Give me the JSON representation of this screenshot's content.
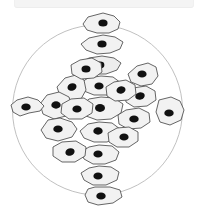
{
  "figure": {
    "kind": "cell-culture-diagram",
    "caption": "",
    "background_color": "#ffffff"
  },
  "top_strip": {
    "visible": true,
    "fill_color": "#f4f4f4",
    "border_color": "#ededed"
  },
  "dish": {
    "label": "culture-dish-outline",
    "shape": "circle",
    "cx": 97.5,
    "cy": 110,
    "r": 85,
    "fill_color": "#ffffff",
    "stroke_color": "#b9b9b9",
    "stroke_width": 0.9
  },
  "style": {
    "cell_fill_color": "#f2f2f2",
    "cell_fill_color_alt": "#ededed",
    "cell_stroke_color": "#4a4a4a",
    "cell_stroke_width": 0.85,
    "nucleus_color": "#111111"
  },
  "cells": [
    {
      "id": "cell-01",
      "group": "vertical-arm",
      "fill": "#f2f2f2",
      "outline": "103,13 114,16 120,22 118,29 109,33 97,33 87,30 83,24 88,17",
      "nucleus": {
        "cx": 103,
        "cy": 23,
        "rx": 4.6,
        "ry": 3.5,
        "rot": 0
      }
    },
    {
      "id": "cell-02",
      "group": "vertical-arm",
      "fill": "#f2f2f2",
      "outline": "103,35 115,37 123,42 120,49 110,53 97,54 86,50 81,44 89,38",
      "nucleus": {
        "cx": 102,
        "cy": 44,
        "rx": 4.6,
        "ry": 3.5,
        "rot": 0
      }
    },
    {
      "id": "cell-03",
      "group": "vertical-arm",
      "fill": "#ededed",
      "outline": "102,56 114,58 121,63 117,70 106,74 94,74 84,70 80,63 89,58",
      "nucleus": {
        "cx": 100,
        "cy": 65,
        "rx": 4.4,
        "ry": 3.4,
        "rot": 0
      }
    },
    {
      "id": "cell-04",
      "group": "vertical-arm",
      "fill": "#f2f2f2",
      "outline": "101,76 113,77 121,83 118,91 107,95 94,95 84,91 79,84 88,78",
      "nucleus": {
        "cx": 99,
        "cy": 86,
        "rx": 4.6,
        "ry": 3.6,
        "rot": 0
      }
    },
    {
      "id": "cell-05",
      "group": "center-cluster",
      "fill": "#f2f2f2",
      "outline": "101,97 114,98 123,104 121,113 111,119 97,120 86,116 80,107 89,99",
      "nucleus": {
        "cx": 100,
        "cy": 108,
        "rx": 5.0,
        "ry": 3.9,
        "rot": 0
      }
    },
    {
      "id": "cell-06",
      "group": "vertical-arm",
      "fill": "#f2f2f2",
      "outline": "99,122 112,123 120,129 118,137 107,142 94,142 84,138 80,131 88,124",
      "nucleus": {
        "cx": 98,
        "cy": 131,
        "rx": 4.7,
        "ry": 3.7,
        "rot": 0
      }
    },
    {
      "id": "cell-07",
      "group": "vertical-arm",
      "fill": "#f2f2f2",
      "outline": "99,145 112,146 119,152 116,160 105,164 93,164 84,159 81,152 89,147",
      "nucleus": {
        "cx": 98,
        "cy": 154,
        "rx": 4.6,
        "ry": 3.6,
        "rot": 0
      }
    },
    {
      "id": "cell-08",
      "group": "vertical-arm",
      "fill": "#f2f2f2",
      "outline": "99,166 111,167 119,172 117,180 106,185 93,185 84,180 81,173 89,168",
      "nucleus": {
        "cx": 98,
        "cy": 176,
        "rx": 4.6,
        "ry": 3.6,
        "rot": 0
      }
    },
    {
      "id": "cell-09",
      "group": "vertical-arm",
      "fill": "#f2f2f2",
      "outline": "95,187 110,187 120,190 122,197 113,203 98,205 88,202 85,195 88,189",
      "nucleus": {
        "cx": 101,
        "cy": 196,
        "rx": 4.7,
        "ry": 3.6,
        "rot": 0
      }
    },
    {
      "id": "cell-10",
      "group": "upper-right",
      "fill": "#f2f2f2",
      "outline": "137,66 148,63 156,67 158,76 152,84 141,86 131,82 128,74",
      "nucleus": {
        "cx": 142,
        "cy": 74,
        "rx": 4.6,
        "ry": 3.6,
        "rot": 0
      }
    },
    {
      "id": "cell-11",
      "group": "right-arm",
      "fill": "#f2f2f2",
      "outline": "133,88 146,86 155,91 156,100 147,106 134,107 126,102 125,93",
      "nucleus": {
        "cx": 140,
        "cy": 96,
        "rx": 4.8,
        "ry": 3.6,
        "rot": -14
      }
    },
    {
      "id": "cell-12",
      "group": "upper-left",
      "fill": "#f2f2f2",
      "outline": "65,78 76,75 84,80 86,90 81,99 70,101 60,96 57,87",
      "nucleus": {
        "cx": 72,
        "cy": 87,
        "rx": 4.6,
        "ry": 3.6,
        "rot": -18
      }
    },
    {
      "id": "cell-13",
      "group": "left-arm",
      "fill": "#f2f2f2",
      "outline": "47,95 59,92 69,97 72,107 66,116 54,119 43,114 40,104",
      "nucleus": {
        "cx": 56,
        "cy": 105,
        "rx": 4.7,
        "ry": 3.7,
        "rot": 0
      }
    },
    {
      "id": "cell-14",
      "group": "left-arm-tip",
      "fill": "#f2f2f2",
      "outline": "17,100 28,97 38,100 44,106 40,111 29,113 20,116 13,112 11,105",
      "nucleus": {
        "cx": 26,
        "cy": 107,
        "rx": 4.7,
        "ry": 3.6,
        "rot": 0
      }
    },
    {
      "id": "cell-15",
      "group": "left-arm",
      "fill": "#f2f2f2",
      "outline": "48,120 60,118 72,122 77,129 72,137 58,141 46,138 41,130",
      "nucleus": {
        "cx": 58,
        "cy": 129,
        "rx": 4.7,
        "ry": 3.6,
        "rot": 0
      }
    },
    {
      "id": "cell-16",
      "group": "center-cluster",
      "fill": "#f2f2f2",
      "outline": "71,99 84,98 93,104 92,113 82,119 69,119 61,113 62,104",
      "nucleus": {
        "cx": 77,
        "cy": 109,
        "rx": 4.6,
        "ry": 3.6,
        "rot": 0
      }
    },
    {
      "id": "cell-17",
      "group": "right-arm",
      "fill": "#f2f2f2",
      "outline": "126,110 139,108 149,113 150,122 141,128 128,129 119,124 118,115",
      "nucleus": {
        "cx": 134,
        "cy": 119,
        "rx": 4.7,
        "ry": 3.6,
        "rot": 0
      }
    },
    {
      "id": "cell-18",
      "group": "right-arm-tip",
      "fill": "#f2f2f2",
      "outline": "159,100 171,97 180,101 184,110 181,120 170,125 160,122 156,112",
      "nucleus": {
        "cx": 169,
        "cy": 113,
        "rx": 4.7,
        "ry": 3.6,
        "rot": 0
      }
    },
    {
      "id": "cell-19",
      "group": "lower-left",
      "fill": "#f2f2f2",
      "outline": "62,142 76,141 86,147 85,156 75,162 62,162 53,156 53,147",
      "nucleus": {
        "cx": 70,
        "cy": 152,
        "rx": 4.7,
        "ry": 3.6,
        "rot": -18
      }
    },
    {
      "id": "cell-20",
      "group": "center-cluster",
      "fill": "#f2f2f2",
      "outline": "114,82 126,80 135,85 136,94 128,100 115,101 107,96 106,87",
      "nucleus": {
        "cx": 121,
        "cy": 90,
        "rx": 4.6,
        "ry": 3.6,
        "rot": -16
      }
    },
    {
      "id": "cell-21",
      "group": "upper-left",
      "fill": "#f2f2f2",
      "outline": "80,60 92,58 101,63 102,72 94,78 81,79 72,74 71,65",
      "nucleus": {
        "cx": 86,
        "cy": 69,
        "rx": 4.5,
        "ry": 3.5,
        "rot": 0
      }
    },
    {
      "id": "cell-22",
      "group": "lower-center",
      "fill": "#f2f2f2",
      "outline": "117,128 129,127 138,132 138,141 129,147 117,147 109,142 108,133",
      "nucleus": {
        "cx": 124,
        "cy": 137,
        "rx": 4.6,
        "ry": 3.6,
        "rot": 0
      }
    }
  ]
}
